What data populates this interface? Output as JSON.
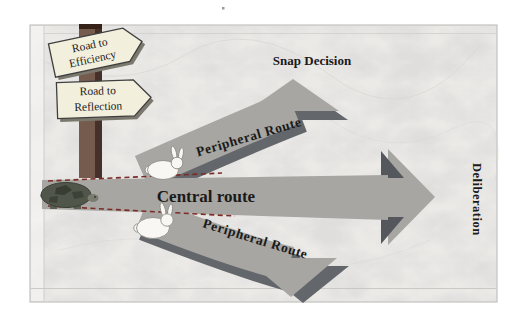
{
  "figure": {
    "signpost": {
      "signs": [
        {
          "line1": "Road to",
          "line2": "Efficiency"
        },
        {
          "line1": "Road to",
          "line2": "Reflection"
        }
      ]
    },
    "labels": {
      "snap_decision": "Snap Decision",
      "central_route": "Central route",
      "peripheral_route_top": "Peripheral Route",
      "peripheral_route_bottom": "Peripheral Route",
      "deliberation": "Deliberation"
    }
  },
  "icons": {
    "turtle": "tortoise-icon",
    "rabbit_top": "rabbit-icon",
    "rabbit_bottom": "rabbit-icon"
  },
  "colors": {
    "marble_base": "#ebeae7",
    "route_gray": "#a7a6a2",
    "route_shadow": "#63666a",
    "dash_red": "#7d2b26",
    "sign_fill": "#f3efdd",
    "sign_border": "#3f3f3f",
    "pole_front": "#755a4e",
    "pole_side": "#46302a"
  }
}
